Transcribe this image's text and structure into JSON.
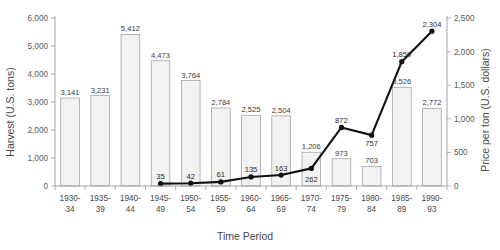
{
  "chart_data": {
    "type": "bar",
    "title": "",
    "xlabel": "Time Period",
    "ylabel": "Harvest (U.S. tons)",
    "y2label": "Price per ton (U.S. dollars)",
    "grid": false,
    "legend": "none",
    "categories": [
      "1930-\n34",
      "1935-\n39",
      "1940-\n44",
      "1945-\n49",
      "1950-\n54",
      "1955-\n59",
      "1960-\n64",
      "1965-\n69",
      "1970-\n74",
      "1975-\n79",
      "1980-\n84",
      "1985-\n89",
      "1990-\n93"
    ],
    "categories_line1": [
      "1930-",
      "1935-",
      "1940-",
      "1945-",
      "1950-",
      "1955-",
      "1960-",
      "1965-",
      "1970-",
      "1975-",
      "1980-",
      "1985-",
      "1990-"
    ],
    "categories_line2": [
      "34",
      "39",
      "44",
      "49",
      "54",
      "59",
      "64",
      "69",
      "74",
      "79",
      "84",
      "89",
      "93"
    ],
    "ylim": [
      0,
      6000
    ],
    "y2lim": [
      0,
      2500
    ],
    "yticks": [
      0,
      1000,
      2000,
      3000,
      4000,
      5000,
      6000
    ],
    "ytick_labels": [
      "0",
      "1,000",
      "2,000",
      "3,000",
      "4,000",
      "5,000",
      "6,000"
    ],
    "y2ticks": [
      0,
      500,
      1000,
      1500,
      2000,
      2500
    ],
    "y2tick_labels": [
      "0",
      "500",
      "1,000",
      "1,500",
      "2,000",
      "2,500"
    ],
    "series": [
      {
        "name": "Harvest",
        "type": "bar",
        "axis": "left",
        "values": [
          3141,
          3231,
          5412,
          4473,
          3764,
          2784,
          2525,
          2504,
          1206,
          973,
          703,
          3526,
          2772
        ],
        "labels": [
          "3,141",
          "3,231",
          "5,412",
          "4,473",
          "3,764",
          "2,784",
          "2,525",
          "2,504",
          "1,206",
          "973",
          "703",
          "3,526",
          "2,772"
        ]
      },
      {
        "name": "Price per ton",
        "type": "line",
        "axis": "right",
        "values": [
          null,
          null,
          null,
          35,
          42,
          61,
          135,
          163,
          262,
          872,
          757,
          1850,
          2304
        ],
        "labels": [
          "",
          "",
          "",
          "35",
          "42",
          "61",
          "135",
          "163",
          "262",
          "872",
          "757",
          "1,850",
          "2,304"
        ]
      }
    ],
    "colors": {
      "bar_fill": "#f2f2f2",
      "bar_stroke": "#9a9a9a",
      "line": "#111111",
      "axis": "#9a9a9a",
      "text": "#3a3a3a"
    }
  }
}
